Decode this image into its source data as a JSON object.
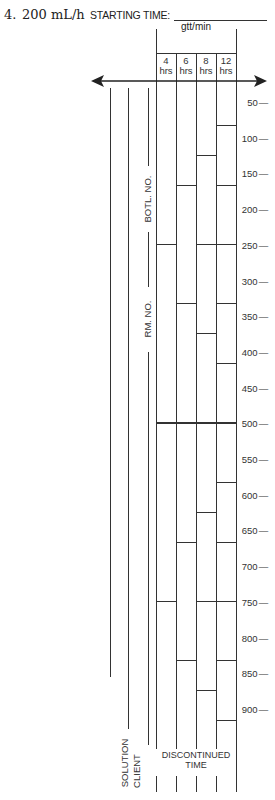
{
  "problem": {
    "number": "4.",
    "rate": "200 mL/h"
  },
  "header": {
    "starting_time_label": "STARTING TIME:",
    "rate_unit": "gtt/min"
  },
  "columns": [
    {
      "hours": "4",
      "unit": "hrs",
      "marks_ml": [
        250,
        500,
        750
      ]
    },
    {
      "hours": "6",
      "unit": "hrs",
      "marks_ml": [
        167,
        333,
        500,
        667,
        833
      ]
    },
    {
      "hours": "8",
      "unit": "hrs",
      "marks_ml": [
        125,
        250,
        375,
        500,
        625,
        750,
        875
      ]
    },
    {
      "hours": "12",
      "unit": "hrs",
      "marks_ml": [
        83,
        167,
        250,
        333,
        417,
        500,
        583,
        667,
        750,
        833,
        917
      ]
    }
  ],
  "scale": {
    "unit": "mL",
    "ticks": [
      "50",
      "100",
      "150",
      "200",
      "250",
      "300",
      "350",
      "400",
      "450",
      "500",
      "550",
      "600",
      "650",
      "700",
      "750",
      "800",
      "850",
      "900"
    ]
  },
  "side_labels": {
    "bottle_no": "BOTL. NO.",
    "room_no": "RM. NO.",
    "solution": "SOLUTION",
    "client": "CLIENT",
    "discontinued_line1": "DISCONTINUED",
    "discontinued_line2": "TIME"
  }
}
